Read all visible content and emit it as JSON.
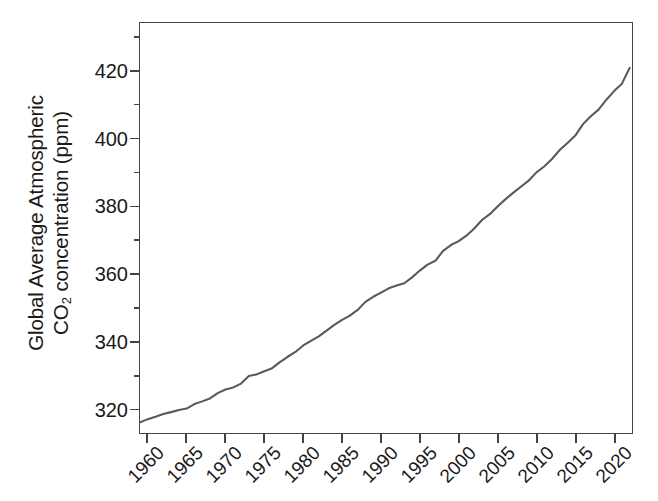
{
  "figure": {
    "width": 658,
    "height": 501,
    "background": "#ffffff",
    "axis_color": "#444444",
    "text_color": "#1a1a1a"
  },
  "axis_titles": {
    "y_line1": "Global Average Atmospheric",
    "y_line2_prefix": "CO",
    "y_line2_sub": "2",
    "y_line2_suffix": " concentration (ppm)",
    "x_title": ""
  },
  "chart_data": {
    "type": "line",
    "title": "",
    "subtitle": "",
    "xlabel": "",
    "ylabel": "Global Average Atmospheric CO2 concentration (ppm)",
    "xlim": [
      1959.0,
      2022.3
    ],
    "ylim": [
      312.8,
      434.4
    ],
    "xticks": [
      1960,
      1965,
      1970,
      1975,
      1980,
      1985,
      1990,
      1995,
      2000,
      2005,
      2010,
      2015,
      2020
    ],
    "xtick_labels": [
      "1960",
      "1965",
      "1970",
      "1975",
      "1980",
      "1985",
      "1990",
      "1995",
      "2000",
      "2005",
      "2010",
      "2015",
      "2020"
    ],
    "xtick_label_rotation": -45,
    "yticks": [
      320,
      340,
      360,
      380,
      400,
      420
    ],
    "ytick_labels": [
      "320",
      "340",
      "360",
      "380",
      "400",
      "420"
    ],
    "y_minor_ticks": [
      330,
      350,
      370,
      390,
      410,
      430
    ],
    "grid": false,
    "legend": null,
    "series": [
      {
        "name": "Global average atmospheric CO2",
        "color": "#5a5a5a",
        "line_width": 2.1,
        "marker": "none",
        "x": [
          1959,
          1960,
          1961,
          1962,
          1963,
          1964,
          1965,
          1966,
          1967,
          1968,
          1969,
          1970,
          1971,
          1972,
          1973,
          1974,
          1975,
          1976,
          1977,
          1978,
          1979,
          1980,
          1981,
          1982,
          1983,
          1984,
          1985,
          1986,
          1987,
          1988,
          1989,
          1990,
          1991,
          1992,
          1993,
          1994,
          1995,
          1996,
          1997,
          1998,
          1999,
          2000,
          2001,
          2002,
          2003,
          2004,
          2005,
          2006,
          2007,
          2008,
          2009,
          2010,
          2011,
          2012,
          2013,
          2014,
          2015,
          2016,
          2017,
          2018,
          2019,
          2020,
          2021,
          2022
        ],
        "y": [
          315.98,
          316.91,
          317.64,
          318.45,
          318.99,
          319.62,
          320.04,
          321.37,
          322.18,
          323.05,
          324.62,
          325.68,
          326.32,
          327.46,
          329.68,
          330.19,
          331.12,
          332.03,
          333.84,
          335.41,
          336.84,
          338.76,
          340.12,
          341.48,
          343.15,
          344.85,
          346.35,
          347.61,
          349.31,
          351.69,
          353.2,
          354.45,
          355.7,
          356.54,
          357.21,
          358.96,
          360.97,
          362.74,
          363.88,
          366.84,
          368.54,
          369.71,
          371.32,
          373.45,
          375.98,
          377.7,
          379.98,
          382.09,
          384.02,
          385.83,
          387.64,
          390.1,
          391.85,
          394.06,
          396.74,
          398.81,
          401.01,
          404.41,
          406.76,
          408.72,
          411.65,
          414.21,
          416.41,
          421.08
        ]
      }
    ]
  }
}
